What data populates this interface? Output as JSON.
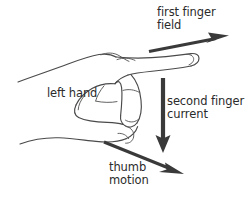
{
  "diagram": {
    "background_color": "#ffffff",
    "ink_color": "#4a4a4a",
    "arrow_color": "#3a3a3a",
    "labels": {
      "first_finger": {
        "name": "first-finger-field",
        "line1": "first finger",
        "line2": "field"
      },
      "left_hand": {
        "name": "left-hand",
        "line1": "left hand"
      },
      "second_finger": {
        "name": "second-finger-current",
        "line1": "second finger",
        "line2": "current"
      },
      "thumb": {
        "name": "thumb-motion",
        "line1": "thumb",
        "line2": "motion"
      }
    },
    "arrows": [
      {
        "name": "field-arrow",
        "direction": "up-right",
        "meaning": "field",
        "from": [
          149,
          51
        ],
        "to": [
          228,
          36
        ]
      },
      {
        "name": "current-arrow",
        "direction": "down",
        "meaning": "current",
        "from": [
          163,
          78
        ],
        "to": [
          163,
          152
        ]
      },
      {
        "name": "motion-arrow",
        "direction": "down-right",
        "meaning": "motion",
        "from": [
          104,
          142
        ],
        "to": [
          183,
          174
        ]
      }
    ]
  }
}
